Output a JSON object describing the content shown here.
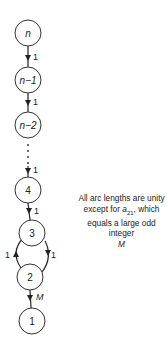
{
  "diagram": {
    "type": "directed-chain-graph",
    "nodes": [
      {
        "id": "n",
        "label": "n",
        "italic": true
      },
      {
        "id": "n-1",
        "label": "n−1",
        "italic": true
      },
      {
        "id": "n-2",
        "label": "n−2",
        "italic": true
      },
      {
        "id": "4",
        "label": "4",
        "italic": false
      },
      {
        "id": "3",
        "label": "3",
        "italic": false
      },
      {
        "id": "2",
        "label": "2",
        "italic": false
      },
      {
        "id": "1",
        "label": "1",
        "italic": false
      }
    ],
    "edges": [
      {
        "from": "n",
        "to": "n-1",
        "label": "1"
      },
      {
        "from": "n-1",
        "to": "n-2",
        "label": "1"
      },
      {
        "from": "n-2",
        "to": "4",
        "label": "1",
        "dotted": true
      },
      {
        "from": "4",
        "to": "3",
        "label": "1"
      },
      {
        "from": "2",
        "to": "3",
        "label": "1",
        "side": "left"
      },
      {
        "from": "3",
        "to": "2",
        "label": "1",
        "side": "right"
      },
      {
        "from": "2",
        "to": "1",
        "label": "M"
      }
    ],
    "note": {
      "line1": "All arc lengths are unity",
      "line2_prefix": "except for ",
      "line2_var": "a",
      "line2_sub": "21",
      "line2_suffix": ", which",
      "line3": "equals a large odd integer",
      "line4": "M"
    }
  }
}
